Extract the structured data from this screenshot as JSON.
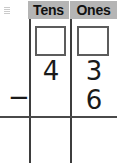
{
  "worksheet": {
    "type": "place-value-subtraction",
    "columns": [
      {
        "key": "tens",
        "header": "Tens"
      },
      {
        "key": "ones",
        "header": "Ones"
      }
    ],
    "regroup_boxes": {
      "tens": "",
      "ones": ""
    },
    "minuend": {
      "tens": "4",
      "ones": "3"
    },
    "subtrahend": {
      "tens": "",
      "ones": "6"
    },
    "operator": "−",
    "answer": {
      "tens": "",
      "ones": ""
    },
    "colors": {
      "header_background": "#b5b5b5",
      "grid_line": "#3d3d3d",
      "rule_line": "#4a4a4a",
      "box_border": "#5c5c5c",
      "digit": "#1a1a1a",
      "page_background": "#ffffff"
    }
  }
}
